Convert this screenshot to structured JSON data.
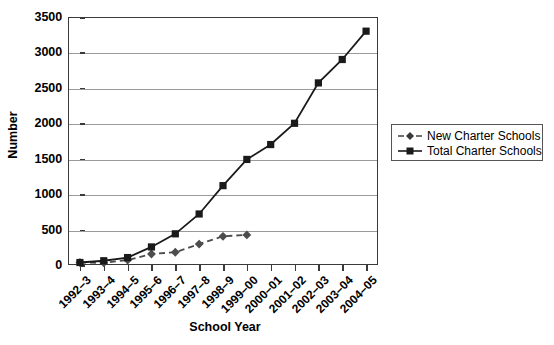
{
  "chart_data": {
    "type": "line",
    "title": "",
    "xlabel": "School Year",
    "ylabel": "Number",
    "ylim": [
      0,
      3500
    ],
    "ytick_step": 500,
    "yticks": [
      0,
      500,
      1000,
      1500,
      2000,
      2500,
      3000,
      3500
    ],
    "grid": true,
    "legend_position": "right",
    "categories": [
      "1992–3",
      "1993–4",
      "1994–5",
      "1995–6",
      "1996–7",
      "1997–8",
      "1998–9",
      "1999–00",
      "2000–01",
      "2001–02",
      "2002–03",
      "2003–04",
      "2004–05"
    ],
    "series": [
      {
        "name": "New Charter Schools",
        "marker": "diamond",
        "linestyle": "dashed",
        "color": "#4d4d4d",
        "values": [
          35,
          30,
          70,
          155,
          180,
          295,
          405,
          425,
          null,
          null,
          null,
          null,
          null
        ]
      },
      {
        "name": "Total Charter Schools",
        "marker": "square",
        "linestyle": "solid",
        "color": "#1a1a1a",
        "values": [
          35,
          60,
          105,
          255,
          440,
          720,
          1120,
          1490,
          1700,
          2000,
          2570,
          2900,
          3300
        ]
      }
    ]
  },
  "axes": {
    "y_title": "Number",
    "x_title": "School Year"
  },
  "legend": {
    "entries": [
      {
        "label": "New Charter Schools",
        "marker": "diamond-marker-icon",
        "style": "dashed"
      },
      {
        "label": "Total Charter Schools",
        "marker": "square-marker-icon",
        "style": "solid"
      }
    ]
  },
  "colors": {
    "frame": "#3a3a3a",
    "grid": "#9a9a9a",
    "new_series": "#4d4d4d",
    "total_series": "#1a1a1a",
    "background": "#ffffff"
  }
}
